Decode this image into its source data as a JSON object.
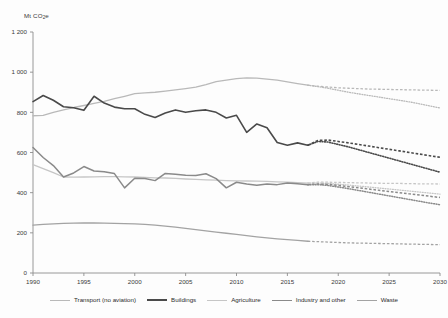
{
  "chart_data": {
    "type": "line",
    "title": "",
    "xlabel": "",
    "ylabel": "Mt CO2e",
    "ylabel_display": "Mt CO",
    "ylabel_sub": "2",
    "ylabel_tail": "e",
    "xlim": [
      1990,
      2030
    ],
    "ylim": [
      0,
      1200
    ],
    "grid": false,
    "legend_position": "bottom",
    "ytick_labels": [
      "1 200",
      "1 000",
      "800",
      "600",
      "400",
      "200",
      "0"
    ],
    "ytick_values": [
      1200,
      1000,
      800,
      600,
      400,
      200,
      0
    ],
    "xtick_labels": [
      "1990",
      "1995",
      "2000",
      "2005",
      "2010",
      "2015",
      "2020",
      "2025",
      "2030"
    ],
    "xtick_values": [
      1990,
      1995,
      2000,
      2005,
      2010,
      2015,
      2020,
      2025,
      2030
    ],
    "history_end_year": 2017,
    "x": [
      1990,
      1991,
      1992,
      1993,
      1994,
      1995,
      1996,
      1997,
      1998,
      1999,
      2000,
      2001,
      2002,
      2003,
      2004,
      2005,
      2006,
      2007,
      2008,
      2009,
      2010,
      2011,
      2012,
      2013,
      2014,
      2015,
      2016,
      2017
    ],
    "series": [
      {
        "name": "Transport (no aviation)",
        "color": "#b9b9b9",
        "width": 1.3,
        "style": "solid",
        "values": [
          783,
          785,
          800,
          812,
          824,
          834,
          845,
          855,
          868,
          880,
          893,
          897,
          900,
          906,
          912,
          918,
          925,
          938,
          953,
          960,
          968,
          972,
          970,
          965,
          960,
          952,
          943,
          935
        ],
        "projection_dashed": {
          "x": [
            2017,
            2018,
            2019,
            2020,
            2021,
            2022,
            2023,
            2024,
            2025,
            2026,
            2027,
            2028,
            2029,
            2030
          ],
          "values": [
            935,
            930,
            926,
            922,
            920,
            918,
            916,
            915,
            914,
            913,
            912,
            911,
            910,
            909
          ]
        },
        "projection_dotted": {
          "x": [
            2017,
            2018,
            2019,
            2020,
            2021,
            2022,
            2023,
            2024,
            2025,
            2026,
            2027,
            2028,
            2029,
            2030
          ],
          "values": [
            935,
            928,
            920,
            910,
            900,
            892,
            884,
            876,
            868,
            860,
            852,
            842,
            832,
            822
          ]
        }
      },
      {
        "name": "Buildings",
        "color": "#4a4a4a",
        "width": 1.6,
        "style": "solid",
        "values": [
          853,
          884,
          860,
          828,
          823,
          810,
          880,
          846,
          826,
          818,
          818,
          790,
          774,
          797,
          812,
          800,
          808,
          812,
          800,
          772,
          785,
          700,
          742,
          723,
          650,
          636,
          648,
          636
        ],
        "projection_dashed": {
          "x": [
            2017,
            2018,
            2019,
            2020,
            2021,
            2022,
            2023,
            2024,
            2025,
            2026,
            2027,
            2028,
            2029,
            2030
          ],
          "values": [
            636,
            660,
            662,
            655,
            648,
            640,
            632,
            624,
            616,
            608,
            600,
            592,
            584,
            576
          ]
        },
        "projection_dotted": {
          "x": [
            2017,
            2018,
            2019,
            2020,
            2021,
            2022,
            2023,
            2024,
            2025,
            2026,
            2027,
            2028,
            2029,
            2030
          ],
          "values": [
            636,
            655,
            652,
            640,
            628,
            614,
            600,
            586,
            572,
            558,
            544,
            530,
            516,
            502
          ]
        }
      },
      {
        "name": "Agriculture",
        "color": "#c6c6c6",
        "width": 1.3,
        "style": "solid",
        "values": [
          540,
          520,
          500,
          478,
          477,
          478,
          479,
          480,
          480,
          479,
          478,
          476,
          474,
          473,
          471,
          468,
          466,
          464,
          462,
          460,
          459,
          458,
          457,
          456,
          454,
          452,
          450,
          448
        ],
        "projection_dashed": {
          "x": [
            2017,
            2018,
            2019,
            2020,
            2021,
            2022,
            2023,
            2024,
            2025,
            2026,
            2027,
            2028,
            2029,
            2030
          ],
          "values": [
            448,
            452,
            452,
            451,
            450,
            449,
            448,
            447,
            446,
            446,
            445,
            444,
            444,
            443
          ]
        },
        "projection_dotted": {
          "x": [
            2017,
            2018,
            2019,
            2020,
            2021,
            2022,
            2023,
            2024,
            2025,
            2026,
            2027,
            2028,
            2029,
            2030
          ],
          "values": [
            448,
            448,
            446,
            442,
            438,
            433,
            428,
            423,
            418,
            413,
            408,
            403,
            398,
            393
          ]
        }
      },
      {
        "name": "Industry and other",
        "color": "#8a8a8a",
        "width": 1.5,
        "style": "solid",
        "values": [
          625,
          575,
          535,
          478,
          498,
          530,
          508,
          504,
          495,
          424,
          472,
          470,
          460,
          496,
          492,
          487,
          486,
          494,
          470,
          424,
          452,
          443,
          437,
          443,
          440,
          448,
          445,
          440
        ],
        "projection_dashed": {
          "x": [
            2017,
            2018,
            2019,
            2020,
            2021,
            2022,
            2023,
            2024,
            2025,
            2026,
            2027,
            2028,
            2029,
            2030
          ],
          "values": [
            440,
            443,
            441,
            436,
            430,
            424,
            418,
            412,
            406,
            400,
            394,
            388,
            382,
            376
          ]
        },
        "projection_dotted": {
          "x": [
            2017,
            2018,
            2019,
            2020,
            2021,
            2022,
            2023,
            2024,
            2025,
            2026,
            2027,
            2028,
            2029,
            2030
          ],
          "values": [
            440,
            440,
            436,
            428,
            420,
            411,
            402,
            393,
            384,
            375,
            366,
            357,
            348,
            340
          ]
        }
      },
      {
        "name": "Waste",
        "color": "#a3a3a3",
        "width": 1.3,
        "style": "solid",
        "values": [
          238,
          242,
          245,
          247,
          248,
          250,
          249,
          248,
          247,
          246,
          245,
          242,
          238,
          233,
          228,
          222,
          216,
          210,
          204,
          198,
          192,
          186,
          180,
          175,
          170,
          166,
          162,
          158
        ],
        "projection_dashed": {
          "x": [
            2017,
            2018,
            2019,
            2020,
            2021,
            2022,
            2023,
            2024,
            2025,
            2026,
            2027,
            2028,
            2029,
            2030
          ],
          "values": [
            158,
            156,
            154,
            152,
            150,
            149,
            148,
            147,
            146,
            145,
            144,
            143,
            142,
            141
          ]
        },
        "projection_dotted": null
      }
    ]
  },
  "legend": {
    "items": [
      {
        "label": "Transport (no aviation)",
        "color": "#b9b9b9",
        "width": 1.3
      },
      {
        "label": "Buildings",
        "color": "#4a4a4a",
        "width": 2.0
      },
      {
        "label": "Agriculture",
        "color": "#c6c6c6",
        "width": 1.3
      },
      {
        "label": "Industry and other",
        "color": "#8a8a8a",
        "width": 1.6
      },
      {
        "label": "Waste",
        "color": "#a3a3a3",
        "width": 1.3
      }
    ]
  },
  "axis": {
    "color": "#8d8d8d"
  }
}
